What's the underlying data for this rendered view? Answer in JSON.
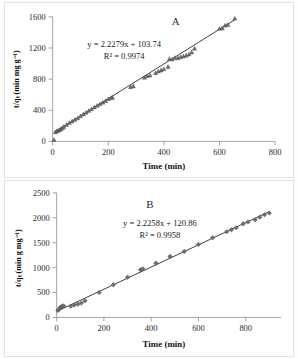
{
  "figure": {
    "panels": [
      "A",
      "B"
    ]
  },
  "chart_data": [
    {
      "type": "scatter",
      "panel_label": "A",
      "title": "",
      "xlabel": "Time (min)",
      "ylabel": "t/qₜ (min mg g⁻¹)",
      "equation": "y = 2.2279x + 103.74",
      "r_squared": "R² = 0.9974",
      "slope": 2.2279,
      "intercept": 103.74,
      "r2_value": 0.9974,
      "xlim": [
        0,
        800
      ],
      "ylim": [
        0,
        1600
      ],
      "xticks": [
        0,
        200,
        400,
        600,
        800
      ],
      "yticks": [
        0,
        400,
        800,
        1200,
        1600
      ],
      "grid": false,
      "legend": "none",
      "marker": "triangle",
      "series": [
        {
          "name": "t/qt vs time",
          "x": [
            5,
            10,
            15,
            20,
            25,
            30,
            35,
            40,
            50,
            60,
            70,
            80,
            90,
            100,
            110,
            120,
            130,
            140,
            150,
            160,
            170,
            180,
            190,
            200,
            210,
            215,
            280,
            290,
            330,
            340,
            350,
            370,
            380,
            390,
            400,
            415,
            420,
            430,
            440,
            450,
            460,
            470,
            480,
            490,
            500,
            510,
            600,
            610,
            620,
            630,
            655
          ],
          "y": [
            20,
            120,
            135,
            140,
            150,
            160,
            175,
            190,
            215,
            240,
            260,
            280,
            300,
            325,
            350,
            370,
            395,
            415,
            440,
            460,
            480,
            500,
            520,
            545,
            560,
            565,
            700,
            710,
            820,
            840,
            850,
            880,
            900,
            915,
            930,
            960,
            1060,
            1055,
            1075,
            1070,
            1085,
            1095,
            1105,
            1120,
            1145,
            1195,
            1450,
            1455,
            1490,
            1500,
            1580
          ]
        }
      ]
    },
    {
      "type": "scatter",
      "panel_label": "B",
      "title": "",
      "xlabel": "Time (min)",
      "ylabel": "t/qₜ  (min g mg⁻¹)",
      "equation": "y = 2.2258x + 120.86",
      "r_squared": "R² = 0.9958",
      "slope": 2.2258,
      "intercept": 120.86,
      "r2_value": 0.9958,
      "xlim": [
        0,
        950
      ],
      "ylim": [
        0,
        2500
      ],
      "xticks": [
        0,
        200,
        400,
        600,
        800
      ],
      "yticks": [
        0,
        500,
        1000,
        1500,
        2000,
        2500
      ],
      "grid": false,
      "legend": "none",
      "marker": "diamond",
      "series": [
        {
          "name": "t/qt vs time",
          "x": [
            5,
            10,
            15,
            20,
            25,
            30,
            60,
            75,
            90,
            105,
            120,
            180,
            240,
            300,
            355,
            365,
            420,
            480,
            540,
            600,
            660,
            720,
            740,
            760,
            790,
            810,
            840,
            860,
            880,
            900
          ],
          "y": [
            140,
            160,
            200,
            215,
            225,
            230,
            225,
            250,
            265,
            290,
            335,
            500,
            655,
            805,
            955,
            975,
            1090,
            1225,
            1325,
            1465,
            1600,
            1720,
            1760,
            1800,
            1880,
            1915,
            1960,
            2010,
            2060,
            2095
          ]
        }
      ]
    }
  ]
}
